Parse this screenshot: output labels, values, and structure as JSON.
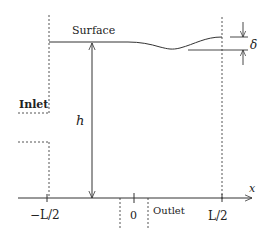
{
  "diagram": {
    "labels": {
      "surface": "Surface",
      "inlet": "Inlet",
      "outlet": "Outlet",
      "height": "h",
      "amplitude": "δ",
      "x_axis": "x",
      "tick_left": "−L/2",
      "tick_origin": "0",
      "tick_right": "L/2"
    },
    "colors": {
      "line": "#333333",
      "dashed": "#555555",
      "background": "#ffffff"
    }
  }
}
